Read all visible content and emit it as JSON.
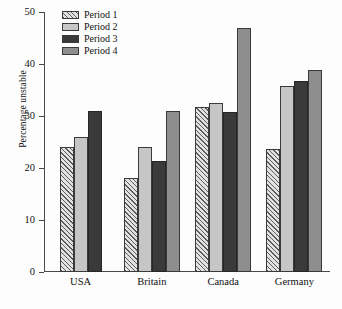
{
  "chart_data": {
    "type": "bar",
    "title": "",
    "xlabel": "",
    "ylabel": "Percentage unstable",
    "categories": [
      "USA",
      "Britain",
      "Canada",
      "Germany"
    ],
    "ylim": [
      0,
      50
    ],
    "yticks": [
      0,
      10,
      20,
      30,
      40,
      50
    ],
    "ytick_labels": [
      "0",
      "10",
      "20",
      "30",
      "40",
      "50"
    ],
    "grid": false,
    "legend_position": "top-left",
    "series": [
      {
        "name": "Period 1",
        "color": "#e2e2e2",
        "pattern": "diagonal-hatch",
        "values": [
          24.0,
          18.0,
          31.8,
          23.7
        ]
      },
      {
        "name": "Period 2",
        "color": "#c6c6c6",
        "pattern": "solid",
        "values": [
          26.0,
          24.0,
          32.5,
          35.7
        ]
      },
      {
        "name": "Period 3",
        "color": "#3a3a3a",
        "pattern": "solid",
        "values": [
          31.0,
          21.4,
          30.8,
          36.7
        ]
      },
      {
        "name": "Period 4",
        "color": "#8e8e8e",
        "pattern": "solid",
        "values": [
          null,
          31.0,
          47.0,
          38.8
        ]
      }
    ]
  }
}
